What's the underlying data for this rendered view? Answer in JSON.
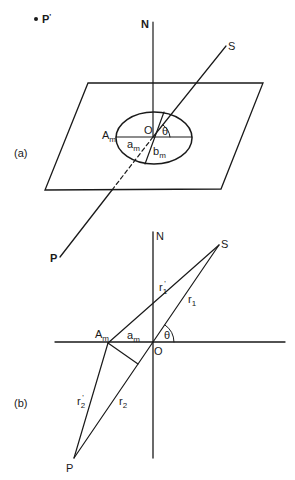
{
  "figure": {
    "panel_a": {
      "label": "(a)",
      "point_p_prime": {
        "label": "P",
        "prime": "'"
      },
      "north": {
        "label": "N"
      },
      "source": {
        "label": "S"
      },
      "receiver": {
        "label": "P"
      },
      "origin": {
        "label": "O"
      },
      "angle": {
        "label": "θ"
      },
      "ellipse_vertex": {
        "label": "A",
        "sub": "m"
      },
      "semi_major": {
        "label": "a",
        "sub": "m"
      },
      "semi_minor": {
        "label": "b",
        "sub": "m"
      }
    },
    "panel_b": {
      "label": "(b)",
      "north": {
        "label": "N"
      },
      "source": {
        "label": "S"
      },
      "receiver": {
        "label": "P"
      },
      "origin": {
        "label": "O"
      },
      "angle": {
        "label": "θ"
      },
      "ellipse_vertex": {
        "label": "A",
        "sub": "m"
      },
      "semi_major": {
        "label": "a",
        "sub": "m"
      },
      "r1_prime": {
        "label": "r",
        "sub": "1",
        "prime": "'"
      },
      "r1": {
        "label": "r",
        "sub": "1"
      },
      "r2_prime": {
        "label": "r",
        "sub": "2",
        "prime": "'"
      },
      "r2": {
        "label": "r",
        "sub": "2"
      }
    }
  }
}
